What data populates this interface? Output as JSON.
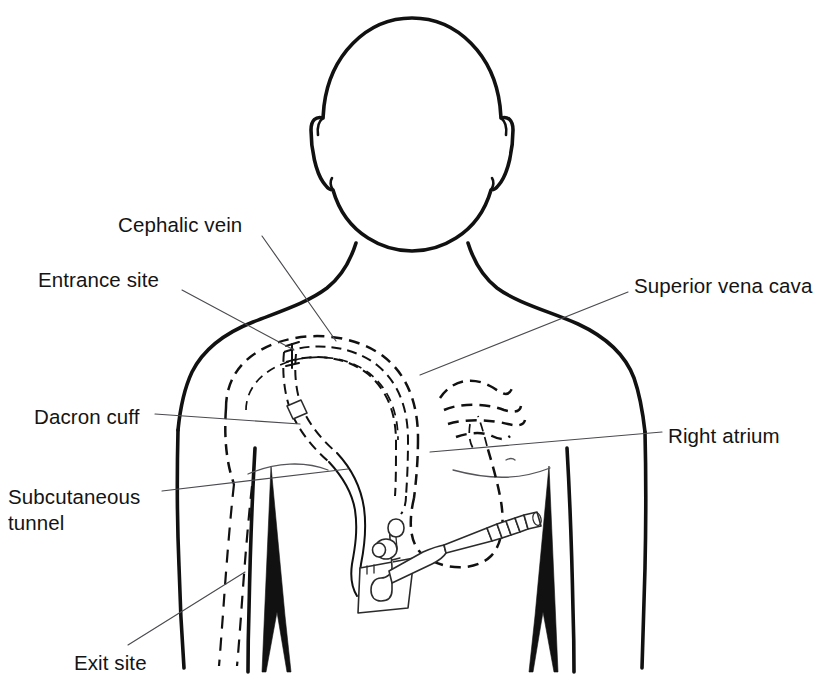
{
  "figure": {
    "line_color": "#111111",
    "leader_color": "#4a4a4f",
    "background": "#ffffff"
  },
  "labels": [
    {
      "id": "cephalic-vein",
      "text": "Cephalic vein",
      "x": 118,
      "y": 226,
      "anchor": "start",
      "leader": "M 262,236 L 336,341"
    },
    {
      "id": "entrance-site",
      "text": "Entrance site",
      "x": 38,
      "y": 281,
      "anchor": "start",
      "leader": "M 182,290 L 294,350"
    },
    {
      "id": "superior-vena-cava",
      "text": "Superior vena cava",
      "x": 634,
      "y": 287,
      "anchor": "start",
      "leader": "M 628,292 L 420,375"
    },
    {
      "id": "dacron-cuff",
      "text": "Dacron cuff",
      "x": 34,
      "y": 418,
      "anchor": "start",
      "leader": "M 155,414 L 300,424"
    },
    {
      "id": "right-atrium",
      "text": "Right atrium",
      "x": 668,
      "y": 437,
      "anchor": "start",
      "leader": "M 662,432 L 430,452"
    },
    {
      "id": "subcutaneous-tunnel",
      "text": "Subcutaneous\ntunnel",
      "x": 8,
      "y": 497,
      "anchor": "start",
      "leader": "M 162,491 L 348,469"
    },
    {
      "id": "exit-site",
      "text": "Exit site",
      "x": 74,
      "y": 666,
      "anchor": "start",
      "leader": "M 128,645 L 245,572"
    }
  ],
  "structures": [
    {
      "id": "head",
      "name": "head outline",
      "style": "solid"
    },
    {
      "id": "neck",
      "name": "neck outline",
      "style": "solid"
    },
    {
      "id": "shoulders",
      "name": "shoulder and torso outline",
      "style": "solid"
    },
    {
      "id": "left-arm",
      "name": "patient left arm outline",
      "style": "solid"
    },
    {
      "id": "right-arm",
      "name": "patient right arm outline",
      "style": "solid"
    },
    {
      "id": "cephalic-vein-path",
      "name": "cephalic vein",
      "style": "dashed"
    },
    {
      "id": "subclavian-vein-path",
      "name": "subclavian vein",
      "style": "dashed"
    },
    {
      "id": "svc-path",
      "name": "superior vena cava",
      "style": "dashed"
    },
    {
      "id": "heart-outline",
      "name": "heart and right atrium",
      "style": "dashed"
    },
    {
      "id": "arm-vein-path",
      "name": "arm vein",
      "style": "dashed"
    },
    {
      "id": "catheter-intravascular",
      "name": "catheter inside vein",
      "style": "dashed"
    },
    {
      "id": "catheter-tunnel",
      "name": "subcutaneous tunnel segment",
      "style": "dashed"
    },
    {
      "id": "catheter-external",
      "name": "external catheter limb",
      "style": "solid"
    },
    {
      "id": "dacron-cuff-marker",
      "name": "Dacron cuff",
      "style": "solid"
    },
    {
      "id": "entrance-site-marker",
      "name": "venous entrance site bracket",
      "style": "solid"
    },
    {
      "id": "dressing-pad",
      "name": "gauze dressing square at exit site",
      "style": "solid"
    },
    {
      "id": "slide-clamp",
      "name": "catheter slide clamp",
      "style": "solid"
    },
    {
      "id": "luer-hub",
      "name": "ribbed luer-lock connector hub",
      "style": "solid"
    },
    {
      "id": "rib-wedge-left",
      "name": "left flank shading wedge",
      "style": "filled"
    },
    {
      "id": "rib-wedge-right",
      "name": "right flank shading wedge",
      "style": "filled"
    }
  ]
}
